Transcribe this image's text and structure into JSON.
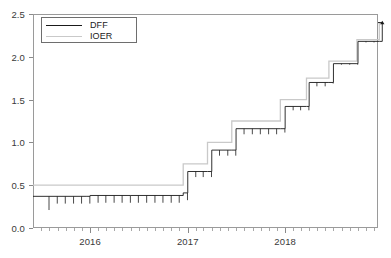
{
  "chart_data": {
    "type": "line",
    "title": "",
    "subtitle": "",
    "xlabel": "",
    "ylabel": "",
    "ylim": [
      0.0,
      2.5
    ],
    "xlim": [
      "2015-06-01",
      "2018-12-15"
    ],
    "grid": false,
    "legend_position": "upper-left-inside",
    "y_ticks": [
      "0.0",
      "0.5",
      "1.0",
      "1.5",
      "2.0",
      "2.5"
    ],
    "y_tick_values": [
      0.0,
      0.5,
      1.0,
      1.5,
      2.0,
      2.5
    ],
    "x_ticks": [
      "2016",
      "2017",
      "2018"
    ],
    "x_tick_values": [
      "2016-01-01",
      "2017-01-01",
      "2018-01-01"
    ],
    "x_minor_tick_interval": "1 month",
    "series": [
      {
        "name": "DFF",
        "color": "#1a1a1a",
        "style": "solid",
        "description": "Daily effective federal funds rate with month-end downward spikes",
        "steps": [
          {
            "date": "2015-06-01",
            "value": 0.37
          },
          {
            "date": "2015-12-17",
            "value": 0.37
          },
          {
            "date": "2016-01-01",
            "value": 0.38
          },
          {
            "date": "2016-06-01",
            "value": 0.38
          },
          {
            "date": "2016-12-15",
            "value": 0.41
          },
          {
            "date": "2017-01-01",
            "value": 0.66
          },
          {
            "date": "2017-03-16",
            "value": 0.66
          },
          {
            "date": "2017-04-01",
            "value": 0.91
          },
          {
            "date": "2017-06-15",
            "value": 0.91
          },
          {
            "date": "2017-07-01",
            "value": 1.16
          },
          {
            "date": "2017-12-14",
            "value": 1.16
          },
          {
            "date": "2018-01-01",
            "value": 1.42
          },
          {
            "date": "2018-03-22",
            "value": 1.42
          },
          {
            "date": "2018-04-01",
            "value": 1.7
          },
          {
            "date": "2018-06-14",
            "value": 1.7
          },
          {
            "date": "2018-07-01",
            "value": 1.92
          },
          {
            "date": "2018-09-27",
            "value": 1.92
          },
          {
            "date": "2018-10-01",
            "value": 2.18
          },
          {
            "date": "2018-12-20",
            "value": 2.18
          },
          {
            "date": "2018-12-31",
            "value": 2.4
          }
        ]
      },
      {
        "name": "IOER",
        "color": "#c9c9c9",
        "style": "solid",
        "description": "Interest rate on excess reserves, clean step function set by the Fed",
        "steps": [
          {
            "date": "2015-06-01",
            "value": 0.5
          },
          {
            "date": "2016-12-15",
            "value": 0.75
          },
          {
            "date": "2017-03-16",
            "value": 1.0
          },
          {
            "date": "2017-06-15",
            "value": 1.25
          },
          {
            "date": "2017-12-14",
            "value": 1.5
          },
          {
            "date": "2018-03-22",
            "value": 1.75
          },
          {
            "date": "2018-06-14",
            "value": 1.95
          },
          {
            "date": "2018-09-27",
            "value": 2.2
          },
          {
            "date": "2018-12-20",
            "value": 2.4
          }
        ]
      }
    ],
    "legend": [
      {
        "label": "DFF",
        "color": "#1a1a1a"
      },
      {
        "label": "IOER",
        "color": "#c9c9c9"
      }
    ]
  },
  "legend": {
    "items": [
      {
        "label": "DFF"
      },
      {
        "label": "IOER"
      }
    ]
  },
  "axes": {
    "y": {
      "ticks": [
        {
          "label": "0.0",
          "value": 0.0
        },
        {
          "label": "0.5",
          "value": 0.5
        },
        {
          "label": "1.0",
          "value": 1.0
        },
        {
          "label": "1.5",
          "value": 1.5
        },
        {
          "label": "2.0",
          "value": 2.0
        },
        {
          "label": "2.5",
          "value": 2.5
        }
      ]
    },
    "x": {
      "ticks": [
        {
          "label": "2016",
          "value": 2016
        },
        {
          "label": "2017",
          "value": 2017
        },
        {
          "label": "2018",
          "value": 2018
        }
      ]
    }
  },
  "colors": {
    "dff": "#1a1a1a",
    "ioer": "#c9c9c9",
    "axis": "#8a8a8a",
    "frame": "#9a9a9a",
    "text": "#3a3a3a",
    "background": "#ffffff"
  }
}
